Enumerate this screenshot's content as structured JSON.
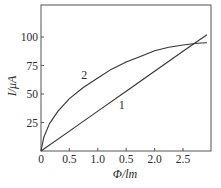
{
  "chart_data": {
    "type": "line",
    "title": "",
    "xlabel": "Φ/lm",
    "ylabel": "I/μA",
    "xlim": [
      0,
      3.0
    ],
    "ylim": [
      0,
      120
    ],
    "grid": false,
    "legend": "inline curve labels",
    "x_ticks": [
      0,
      0.5,
      1.0,
      1.5,
      2.0,
      2.5
    ],
    "x_tick_labels": [
      "0",
      "0.5",
      "1.0",
      "0.5",
      "2.0",
      "2.5"
    ],
    "y_ticks": [
      25,
      50,
      75,
      100
    ],
    "y_tick_labels": [
      "25",
      "50",
      "75",
      "100"
    ],
    "series": [
      {
        "name": "1",
        "label_pos": [
          1.42,
          37
        ],
        "x": [
          0,
          0.5,
          1.0,
          1.5,
          2.0,
          2.5,
          2.92
        ],
        "y": [
          0,
          17.5,
          35,
          52.5,
          70,
          87.5,
          102
        ]
      },
      {
        "name": "2",
        "label_pos": [
          0.76,
          63
        ],
        "x": [
          0,
          0.05,
          0.15,
          0.3,
          0.5,
          0.75,
          1.0,
          1.25,
          1.5,
          1.75,
          2.0,
          2.25,
          2.5,
          2.75,
          2.92
        ],
        "y": [
          0,
          12,
          24,
          35,
          46,
          56,
          64,
          72,
          78,
          83,
          88,
          91,
          93,
          94.5,
          95
        ]
      }
    ]
  }
}
